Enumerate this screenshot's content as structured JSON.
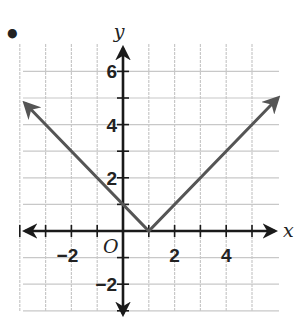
{
  "problem_marker": "•",
  "chart_data": {
    "type": "line",
    "title": "",
    "xlabel": "x",
    "ylabel": "y",
    "origin_label": "O",
    "xlim": [
      -4,
      6
    ],
    "ylim": [
      -3,
      7
    ],
    "grid": true,
    "x_ticks": [
      -4,
      -3,
      -2,
      -1,
      0,
      1,
      2,
      3,
      4,
      5
    ],
    "y_ticks": [
      -3,
      -2,
      -1,
      0,
      1,
      2,
      3,
      4,
      5,
      6
    ],
    "x_tick_labels": [
      {
        "value": -2,
        "label": "−2"
      },
      {
        "value": 2,
        "label": "2"
      },
      {
        "value": 4,
        "label": "4"
      }
    ],
    "y_tick_labels": [
      {
        "value": 6,
        "label": "6"
      },
      {
        "value": 4,
        "label": "4"
      },
      {
        "value": 2,
        "label": "2"
      },
      {
        "value": -2,
        "label": "−2"
      }
    ],
    "series": [
      {
        "name": "y = |x − 1|",
        "x": [
          -3.8,
          1,
          6
        ],
        "y": [
          4.8,
          0,
          5
        ],
        "arrows_at_ends": true,
        "color": "#555555"
      }
    ],
    "legend": null
  },
  "colors": {
    "grid": "#c8c8c8",
    "axis": "#1a1a1a",
    "curve": "#555555"
  }
}
